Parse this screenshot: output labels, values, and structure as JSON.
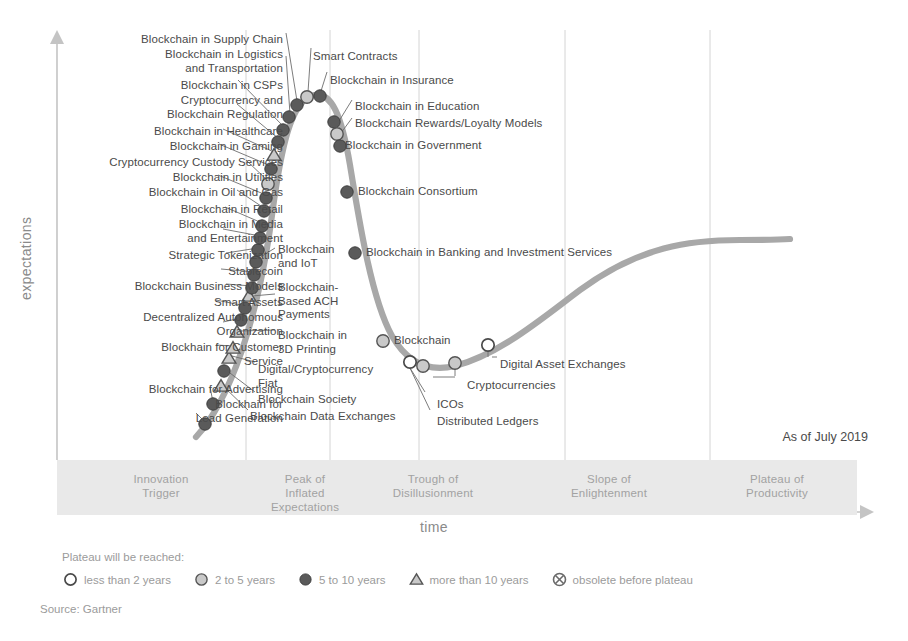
{
  "chart_data": {
    "type": "line",
    "xlabel": "time",
    "ylabel": "expectations",
    "as_of": "As of July 2019",
    "source": "Source: Gartner",
    "grid": true,
    "legend_position": "bottom",
    "phases": [
      {
        "name": "Innovation Trigger",
        "lines": [
          "Innovation",
          "Trigger"
        ],
        "x_start": 0,
        "x_end": 26
      },
      {
        "name": "Peak of Inflated Expectations",
        "lines": [
          "Peak of",
          "Inflated",
          "Expectations"
        ],
        "x_start": 26,
        "x_end": 36
      },
      {
        "name": "Trough of Disillusionment",
        "lines": [
          "Trough of",
          "Disillusionment"
        ],
        "x_start": 36,
        "x_end": 58
      },
      {
        "name": "Slope of Enlightenment",
        "lines": [
          "Slope of",
          "Enlightenment"
        ],
        "x_start": 58,
        "x_end": 80
      },
      {
        "name": "Plateau of Productivity",
        "lines": [
          "Plateau of",
          "Productivity"
        ],
        "x_start": 80,
        "x_end": 100
      }
    ],
    "legend": {
      "title": "Plateau will be reached:",
      "items": [
        {
          "marker": "open-circle",
          "label": "less than 2 years"
        },
        {
          "marker": "light-circle",
          "label": "2 to 5 years"
        },
        {
          "marker": "dark-circle",
          "label": "5 to 10 years"
        },
        {
          "marker": "triangle",
          "label": "more than 10 years"
        },
        {
          "marker": "crossed-circle",
          "label": "obsolete before plateau"
        }
      ]
    },
    "points": [
      {
        "label": "Blockhain for Lead Generation",
        "marker": "dark-circle",
        "x": 205,
        "y": 424
      },
      {
        "label": "Blockhain for Advertising",
        "marker": "dark-circle",
        "x": 213,
        "y": 404
      },
      {
        "label": "Blockchain Data Exchanges",
        "marker": "triangle",
        "x": 221,
        "y": 386
      },
      {
        "label": "Blockchain Society",
        "marker": "dark-circle",
        "x": 224,
        "y": 371
      },
      {
        "label": "Digital/Cryptocurrency Fiat",
        "marker": "triangle",
        "x": 229,
        "y": 358
      },
      {
        "label": "Blockhain for Customer Service",
        "marker": "triangle",
        "x": 233,
        "y": 348
      },
      {
        "label": "Blockchain in 3D Printing",
        "marker": "triangle",
        "x": 237,
        "y": 332
      },
      {
        "label": "Decentralized Autonomous Organization",
        "marker": "dark-circle",
        "x": 241,
        "y": 320
      },
      {
        "label": "Smart Assets",
        "marker": "dark-circle",
        "x": 245,
        "y": 308
      },
      {
        "label": "Blockchain-Based ACH Payments",
        "marker": "triangle",
        "x": 249,
        "y": 296
      },
      {
        "label": "Blockchain Business Models",
        "marker": "dark-circle",
        "x": 252,
        "y": 288
      },
      {
        "label": "Stablecoin",
        "marker": "dark-circle",
        "x": 254,
        "y": 275
      },
      {
        "label": "Blockchain and IoT",
        "marker": "dark-circle",
        "x": 256,
        "y": 262
      },
      {
        "label": "Strategic Tokenization",
        "marker": "dark-circle",
        "x": 258,
        "y": 250
      },
      {
        "label": "Blockchain in Media and Entertainment",
        "marker": "dark-circle",
        "x": 260,
        "y": 238
      },
      {
        "label": "Blockchain in Retail",
        "marker": "dark-circle",
        "x": 262,
        "y": 226
      },
      {
        "label": "Blockchain in Oil and Gas",
        "marker": "dark-circle",
        "x": 264,
        "y": 211
      },
      {
        "label": "Blockchain in Utilities",
        "marker": "dark-circle",
        "x": 266,
        "y": 198
      },
      {
        "label": "Cryptocurrency Custody Services",
        "marker": "light-circle",
        "x": 268,
        "y": 184
      },
      {
        "label": "Blockchain in Gaming",
        "marker": "dark-circle",
        "x": 271,
        "y": 169
      },
      {
        "label": "Blockchain in Healthcare",
        "marker": "triangle",
        "x": 274,
        "y": 155
      },
      {
        "label": "Cryptocurrency and Blockchain Regulation",
        "marker": "dark-circle",
        "x": 278,
        "y": 142
      },
      {
        "label": "Blockchain in CSPs",
        "marker": "dark-circle",
        "x": 283,
        "y": 130
      },
      {
        "label": "Blockchain in Logistics and Transportation",
        "marker": "dark-circle",
        "x": 289,
        "y": 117
      },
      {
        "label": "Blockchain in Supply Chain",
        "marker": "dark-circle",
        "x": 297,
        "y": 105
      },
      {
        "label": "Smart Contracts",
        "marker": "light-circle",
        "x": 307,
        "y": 97
      },
      {
        "label": "Blockchain in Insurance",
        "marker": "dark-circle",
        "x": 320,
        "y": 96
      },
      {
        "label": "Blockchain in Education",
        "marker": "dark-circle",
        "x": 334,
        "y": 122
      },
      {
        "label": "Blockchain Rewards/Loyalty Models",
        "marker": "light-circle",
        "x": 337,
        "y": 134
      },
      {
        "label": "Blockchain in Government",
        "marker": "dark-circle",
        "x": 340,
        "y": 146
      },
      {
        "label": "Blockchain Consortium",
        "marker": "dark-circle",
        "x": 347,
        "y": 192
      },
      {
        "label": "Blockchain in Banking and Investment Services",
        "marker": "dark-circle",
        "x": 355,
        "y": 253
      },
      {
        "label": "Blockchain",
        "marker": "light-circle",
        "x": 383,
        "y": 341
      },
      {
        "label": "Distributed Ledgers",
        "marker": "open-circle",
        "x": 410,
        "y": 362
      },
      {
        "label": "ICOs",
        "marker": "light-circle",
        "x": 423,
        "y": 366
      },
      {
        "label": "Cryptocurrencies",
        "marker": "light-circle",
        "x": 455,
        "y": 363
      },
      {
        "label": "Digital Asset Exchanges",
        "marker": "open-circle",
        "x": 488,
        "y": 345
      }
    ],
    "labels_left": [
      {
        "lines": [
          "Blockchain in Supply Chain"
        ],
        "x": 120,
        "y": 33,
        "align": "right",
        "right_edge": 283
      },
      {
        "lines": [
          "Blockchain in Logistics",
          "and Transportation"
        ],
        "x": 120,
        "y": 48,
        "align": "right",
        "right_edge": 283
      },
      {
        "lines": [
          "Blockchain in CSPs"
        ],
        "x": 120,
        "y": 79,
        "align": "right",
        "right_edge": 283
      },
      {
        "lines": [
          "Cryptocurrency and",
          "Blockchain Regulation"
        ],
        "x": 120,
        "y": 94,
        "align": "right",
        "right_edge": 283
      },
      {
        "lines": [
          "Blockchain in Healthcare"
        ],
        "x": 95,
        "y": 125,
        "align": "right",
        "right_edge": 283
      },
      {
        "lines": [
          "Blockchain in Gaming"
        ],
        "x": 95,
        "y": 140,
        "align": "right",
        "right_edge": 283
      },
      {
        "lines": [
          "Cryptocurrency Custody Services"
        ],
        "x": 55,
        "y": 156,
        "align": "right",
        "right_edge": 283
      },
      {
        "lines": [
          "Blockchain in Utilities"
        ],
        "x": 95,
        "y": 171,
        "align": "right",
        "right_edge": 283
      },
      {
        "lines": [
          "Blockchain in Oil and Gas"
        ],
        "x": 95,
        "y": 186,
        "align": "right",
        "right_edge": 283
      },
      {
        "lines": [
          "Blockchain in Retail"
        ],
        "x": 95,
        "y": 203,
        "align": "right",
        "right_edge": 283
      },
      {
        "lines": [
          "Blockchain in Media",
          "and Entertainment"
        ],
        "x": 95,
        "y": 218,
        "align": "right",
        "right_edge": 283
      },
      {
        "lines": [
          "Strategic Tokenization"
        ],
        "x": 95,
        "y": 249,
        "align": "right",
        "right_edge": 283
      },
      {
        "lines": [
          "Stablecoin"
        ],
        "x": 95,
        "y": 265,
        "align": "right",
        "right_edge": 283
      },
      {
        "lines": [
          "Blockchain Business Models"
        ],
        "x": 60,
        "y": 280,
        "align": "right",
        "right_edge": 283
      },
      {
        "lines": [
          "Smart Assets"
        ],
        "x": 95,
        "y": 296,
        "align": "right",
        "right_edge": 283
      },
      {
        "lines": [
          "Decentralized Autonomous",
          "Organization"
        ],
        "x": 60,
        "y": 311,
        "align": "right",
        "right_edge": 283
      },
      {
        "lines": [
          "Blockhain for Customer",
          "Service"
        ],
        "x": 65,
        "y": 341,
        "align": "right",
        "right_edge": 283
      },
      {
        "lines": [
          "Blockchain for Advertising"
        ],
        "x": 65,
        "y": 383,
        "align": "right",
        "right_edge": 283
      },
      {
        "lines": [
          "Blockhain for",
          "Lead Generation"
        ],
        "x": 65,
        "y": 398,
        "align": "right",
        "right_edge": 283
      }
    ],
    "labels_mid": [
      {
        "lines": [
          "Blockchain",
          "and IoT"
        ],
        "x": 278,
        "y": 243
      },
      {
        "lines": [
          "Blockchain-",
          "Based ACH",
          "Payments"
        ],
        "x": 278,
        "y": 281
      },
      {
        "lines": [
          "Blockchain in",
          "3D Printing"
        ],
        "x": 278,
        "y": 329
      },
      {
        "lines": [
          "Digital/Cryptocurrency",
          "Fiat"
        ],
        "x": 258,
        "y": 363
      },
      {
        "lines": [
          "Blockchain Society"
        ],
        "x": 258,
        "y": 393
      },
      {
        "lines": [
          "Blockchain Data Exchanges"
        ],
        "x": 250,
        "y": 410
      }
    ],
    "labels_right": [
      {
        "lines": [
          "Smart Contracts"
        ],
        "x": 313,
        "y": 50
      },
      {
        "lines": [
          "Blockchain in Insurance"
        ],
        "x": 330,
        "y": 74
      },
      {
        "lines": [
          "Blockchain in Education"
        ],
        "x": 355,
        "y": 100
      },
      {
        "lines": [
          "Blockchain Rewards/Loyalty Models"
        ],
        "x": 355,
        "y": 117
      },
      {
        "lines": [
          "Blockchain in Government"
        ],
        "x": 345,
        "y": 139
      },
      {
        "lines": [
          "Blockchain Consortium"
        ],
        "x": 358,
        "y": 185
      },
      {
        "lines": [
          "Blockchain in Banking and Investment Services"
        ],
        "x": 366,
        "y": 246
      },
      {
        "lines": [
          "Blockchain"
        ],
        "x": 394,
        "y": 334
      },
      {
        "lines": [
          "Digital Asset Exchanges"
        ],
        "x": 500,
        "y": 358
      },
      {
        "lines": [
          "Cryptocurrencies"
        ],
        "x": 467,
        "y": 379
      },
      {
        "lines": [
          "ICOs"
        ],
        "x": 437,
        "y": 398
      },
      {
        "lines": [
          "Distributed Ledgers"
        ],
        "x": 437,
        "y": 415
      }
    ],
    "colors": {
      "curve": "#a6a6a6",
      "dark_marker": "#5a5a5a",
      "light_marker": "#c9c9c9",
      "band": "#e9e9e9",
      "text": "#4a4a4a",
      "muted_text": "#9b9b9b",
      "gridline": "#d0d0d0"
    },
    "gridlines_x": [
      246,
      330,
      419,
      565,
      710
    ]
  }
}
